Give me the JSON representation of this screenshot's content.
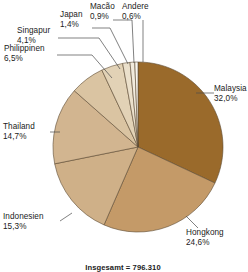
{
  "chart_data": {
    "type": "pie",
    "title": "",
    "subtitle": "",
    "xlabel": "",
    "ylabel": "",
    "legend_position": "labels-outside-with-leader-lines",
    "grid": false,
    "value_suffix": "%",
    "decimal_separator": ",",
    "total_caption": "Insgesamt = 796.310",
    "start_angle_deg": 0,
    "direction": "clockwise",
    "categories": [
      "Malaysia",
      "Hongkong",
      "Indonesien",
      "Thailand",
      "Philippinen",
      "Singapur",
      "Japan",
      "Macão",
      "Andere"
    ],
    "values": [
      32.0,
      24.6,
      15.3,
      14.7,
      6.5,
      4.1,
      1.4,
      0.9,
      0.6
    ],
    "value_labels": [
      "32,0%",
      "24,6%",
      "15,3%",
      "14,7%",
      "6,5%",
      "4,1%",
      "1,4%",
      "0,9%",
      "0,6%"
    ],
    "colors": [
      "#9a6a2b",
      "#c49a68",
      "#cfb088",
      "#d2b590",
      "#dac4a2",
      "#e2d2b6",
      "#ebe0cb",
      "#f2ebdd",
      "#f9f6ef"
    ],
    "slices": [
      {
        "label": "Malaysia",
        "value": 32.0,
        "value_label": "32,0%",
        "color": "#9a6a2b"
      },
      {
        "label": "Hongkong",
        "value": 24.6,
        "value_label": "24,6%",
        "color": "#c49a68"
      },
      {
        "label": "Indonesien",
        "value": 15.3,
        "value_label": "15,3%",
        "color": "#cfb088"
      },
      {
        "label": "Thailand",
        "value": 14.7,
        "value_label": "14,7%",
        "color": "#d2b590"
      },
      {
        "label": "Philippinen",
        "value": 6.5,
        "value_label": "6,5%",
        "color": "#dac4a2"
      },
      {
        "label": "Singapur",
        "value": 4.1,
        "value_label": "4,1%",
        "color": "#e2d2b6"
      },
      {
        "label": "Japan",
        "value": 1.4,
        "value_label": "1,4%",
        "color": "#ebe0cb"
      },
      {
        "label": "Macão",
        "value": 0.9,
        "value_label": "0,9%",
        "color": "#f2ebdd"
      },
      {
        "label": "Andere",
        "value": 0.6,
        "value_label": "0,6%",
        "color": "#f9f6ef"
      }
    ]
  },
  "labels": {
    "malaysia": {
      "name": "Malaysia",
      "value": "32,0%"
    },
    "hongkong": {
      "name": "Hongkong",
      "value": "24,6%"
    },
    "indonesien": {
      "name": "Indonesien",
      "value": "15,3%"
    },
    "thailand": {
      "name": "Thailand",
      "value": "14,7%"
    },
    "philippinen": {
      "name": "Philippinen",
      "value": "6,5%"
    },
    "singapur": {
      "name": "Singapur",
      "value": "4,1%"
    },
    "japan": {
      "name": "Japan",
      "value": "1,4%"
    },
    "macao": {
      "name": "Macão",
      "value": "0,9%"
    },
    "andere": {
      "name": "Andere",
      "value": "0,6%"
    }
  },
  "footer": {
    "total": "Insgesamt = 796.310"
  }
}
